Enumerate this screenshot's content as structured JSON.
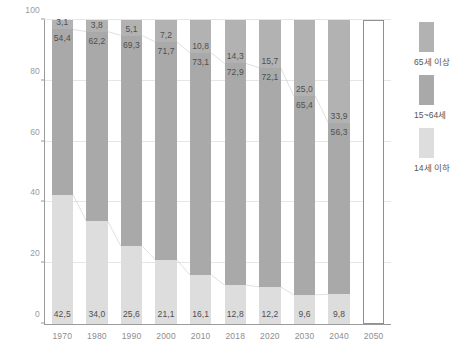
{
  "chart_data": {
    "type": "bar",
    "stacked": true,
    "title": "",
    "xlabel": "",
    "ylabel": "",
    "ylim": [
      0,
      100
    ],
    "yticks": [
      0,
      20,
      40,
      60,
      80,
      100
    ],
    "grid": true,
    "legend_position": "right",
    "categories": [
      "1970",
      "1980",
      "1990",
      "2000",
      "2010",
      "2018",
      "2020",
      "2030",
      "2040",
      "2050"
    ],
    "series": [
      {
        "name": "65세 이상",
        "color": "#b2b2b2",
        "values": [
          3.1,
          3.8,
          5.1,
          7.2,
          10.8,
          14.3,
          15.7,
          25.0,
          33.9,
          null
        ]
      },
      {
        "name": "15~64세",
        "color": "#a9a9a9",
        "values": [
          54.4,
          62.2,
          69.3,
          71.7,
          73.1,
          72.9,
          72.1,
          65.4,
          56.3,
          null
        ]
      },
      {
        "name": "14세 이하",
        "color": "#dddddd",
        "values": [
          42.5,
          34.0,
          25.6,
          21.1,
          16.1,
          12.8,
          12.2,
          9.6,
          9.8,
          null
        ]
      }
    ],
    "empty_category": "2050",
    "connector_lines": true
  },
  "axes": {
    "y_tick_labels": [
      "0",
      "20",
      "40",
      "60",
      "80",
      "100"
    ],
    "x_tick_labels": [
      "1970",
      "1980",
      "1990",
      "2000",
      "2010",
      "2018",
      "2020",
      "2030",
      "2040",
      "2050"
    ]
  },
  "legend": {
    "items": [
      {
        "label": "65세 이상",
        "color": "#b2b2b2"
      },
      {
        "label": "15~64세",
        "color": "#a9a9a9"
      },
      {
        "label": "14세 이하",
        "color": "#dddddd"
      }
    ]
  }
}
